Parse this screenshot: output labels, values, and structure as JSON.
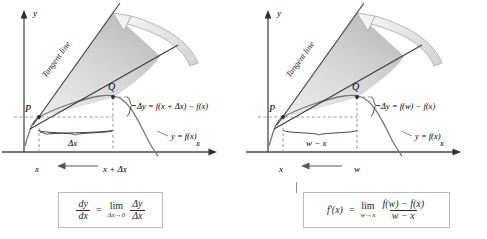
{
  "figure": {
    "panels": [
      {
        "id": "delta-notation",
        "axis_x_label": "x",
        "axis_y_label": "y",
        "tangent_label": "Tangent line",
        "point_p_label": "P",
        "point_q_label": "Q",
        "curve_label": "y = f(x)",
        "delta_y_label": "Δy = f(x + Δx) − f(x)",
        "brace_label": "Δx",
        "tick_left_label": "x",
        "tick_right_label": "x + Δx",
        "arrow_direction": "left",
        "formula": {
          "lhs_num": "dy",
          "lhs_den": "dx",
          "equals": "=",
          "lim_word": "lim",
          "lim_sub": "Δx→0",
          "rhs_num": "Δy",
          "rhs_den": "Δx"
        }
      },
      {
        "id": "w-notation",
        "axis_x_label": "x",
        "axis_y_label": "y",
        "tangent_label": "Tangent line",
        "point_p_label": "P",
        "point_q_label": "Q",
        "curve_label": "y = f(x)",
        "delta_y_label": "Δy = f(w) − f(x)",
        "brace_label": "w − x",
        "tick_left_label": "x",
        "tick_right_label": "w",
        "arrow_direction": "left",
        "formula": {
          "lhs": "f′(x)",
          "equals": "=",
          "lim_word": "lim",
          "lim_sub": "w→x",
          "rhs_num": "f(w) − f(x)",
          "rhs_den": "w − x"
        }
      }
    ],
    "colors": {
      "ink": "#1c1c1c",
      "axis": "#4a4a4a",
      "curve": "#6b6b6b",
      "fan_fill_light": "#e3e3e3",
      "fan_fill_dark": "#bdbdbd",
      "arrow_outline": "#9a9a9a",
      "box_border": "#b9b9b9",
      "dashed": "#8a8a8a"
    }
  }
}
